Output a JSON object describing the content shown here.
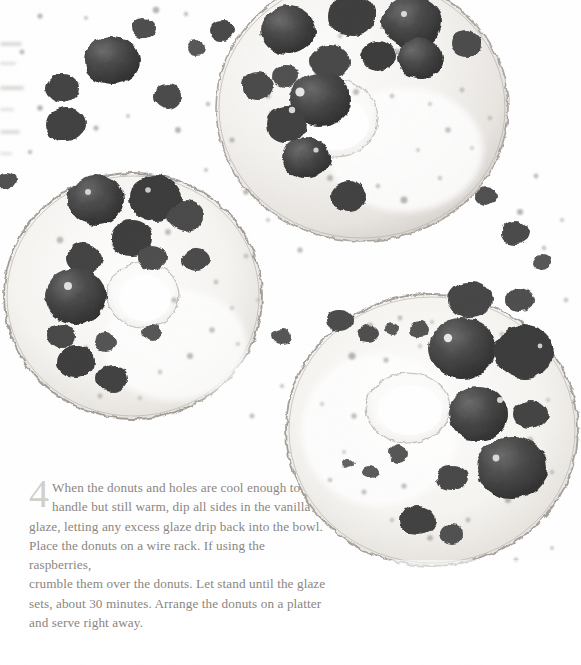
{
  "page": {
    "width": 581,
    "height": 665,
    "background_color": "#ffffff",
    "kind": "cookbook-recipe-page"
  },
  "photo": {
    "alt": "Overhead monochrome photograph of three glazed ring donuts topped with crumbled dark raspberries and scattered crumbs on a white surface",
    "subject": "glazed donuts with crumbled raspberries",
    "style": "black-and-white food photography",
    "donuts": [
      {
        "name": "top-right-donut",
        "cx": 360,
        "cy": 110,
        "rx": 145,
        "ry": 130
      },
      {
        "name": "left-donut",
        "cx": 135,
        "cy": 295,
        "rx": 128,
        "ry": 122
      },
      {
        "name": "bottom-right-donut",
        "cx": 430,
        "cy": 430,
        "rx": 145,
        "ry": 135
      }
    ],
    "palette": {
      "background": "#ffffff",
      "glaze_light": "#f4f3f1",
      "glaze_shadow": "#ddd9d4",
      "donut_edge": "#9b9690",
      "berry_dark": "#3a3a3a",
      "berry_mid": "#5f5f5f",
      "crumb_light": "#b9b6b2"
    }
  },
  "step": {
    "number": "4",
    "lines": [
      "When the donuts and holes are cool enough to",
      "handle but still warm, dip all sides in the vanilla",
      "glaze, letting any excess glaze drip back into the bowl.",
      "Place the donuts on a wire rack. If using the raspberries,",
      "crumble them over the donuts. Let stand until the glaze",
      "sets, about 30 minutes. Arrange the donuts on a platter",
      "and serve right away."
    ],
    "text_color": "#8a8681",
    "number_color": "#d2cfca"
  }
}
